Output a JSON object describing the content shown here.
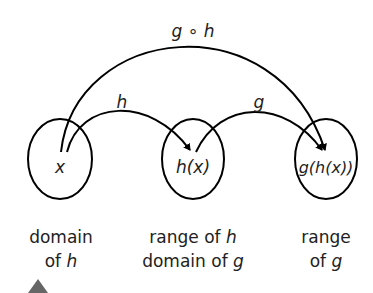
{
  "diagram": {
    "type": "function-composition",
    "sets": [
      {
        "id": "domain-h",
        "element": "x",
        "caption_line1": "domain",
        "caption_line2_prefix": "of ",
        "caption_line2_var": "h"
      },
      {
        "id": "range-h",
        "element": "h(x)",
        "caption_line1_prefix": "range of ",
        "caption_line1_var": "h",
        "caption_line2_prefix": "domain of ",
        "caption_line2_var": "g"
      },
      {
        "id": "range-g",
        "element": "g(h(x))",
        "caption_line1": "range",
        "caption_line2_prefix": "of ",
        "caption_line2_var": "g"
      }
    ],
    "arrows": [
      {
        "label": "h",
        "from": "x",
        "to": "h(x)"
      },
      {
        "label": "g",
        "from": "h(x)",
        "to": "g(h(x))"
      },
      {
        "label": "g ∘ h",
        "from": "x",
        "to": "g(h(x))"
      }
    ],
    "colors": {
      "stroke": "#000000",
      "text": "#222222",
      "marker": "#666666"
    }
  }
}
